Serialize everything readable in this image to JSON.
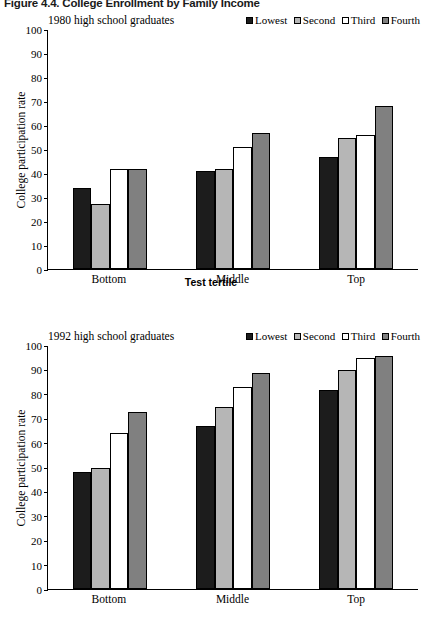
{
  "figure": {
    "title": "Figure 4.4.  College Enrollment by Family Income"
  },
  "colors": {
    "lowest": "#1c1c1c",
    "second": "#b6b6b6",
    "third": "#ffffff",
    "fourth": "#808080",
    "axis": "#000000",
    "background": "#ffffff"
  },
  "legend": {
    "items": [
      {
        "label": "Lowest",
        "color": "#1c1c1c"
      },
      {
        "label": "Second",
        "color": "#b6b6b6"
      },
      {
        "label": "Third",
        "color": "#ffffff"
      },
      {
        "label": "Fourth",
        "color": "#808080"
      }
    ]
  },
  "panels": [
    {
      "subtitle": "1980 high school graduates",
      "xlabel": "Test tertile"
    },
    {
      "subtitle": "1992 high school graduates",
      "xlabel": ""
    }
  ],
  "chart_data": [
    {
      "type": "bar",
      "title": "1980 high school graduates",
      "xlabel": "Test tertile",
      "ylabel": "College participation rate",
      "categories": [
        "Bottom",
        "Middle",
        "Top"
      ],
      "ylim": [
        0,
        100
      ],
      "yticks": [
        0,
        10,
        20,
        30,
        40,
        50,
        60,
        70,
        80,
        90,
        100
      ],
      "grid": false,
      "legend_position": "top-right",
      "series": [
        {
          "name": "Lowest",
          "color": "#1c1c1c",
          "values": [
            34,
            41,
            47
          ]
        },
        {
          "name": "Second",
          "color": "#b6b6b6",
          "values": [
            27,
            42,
            55
          ]
        },
        {
          "name": "Third",
          "color": "#ffffff",
          "values": [
            42,
            51,
            56
          ]
        },
        {
          "name": "Fourth",
          "color": "#808080",
          "values": [
            42,
            57,
            68
          ]
        }
      ]
    },
    {
      "type": "bar",
      "title": "1992 high school graduates",
      "xlabel": "",
      "ylabel": "College participation rate",
      "categories": [
        "Bottom",
        "Middle",
        "Top"
      ],
      "ylim": [
        0,
        100
      ],
      "yticks": [
        0,
        10,
        20,
        30,
        40,
        50,
        60,
        70,
        80,
        90,
        100
      ],
      "grid": false,
      "legend_position": "top-right",
      "series": [
        {
          "name": "Lowest",
          "color": "#1c1c1c",
          "values": [
            48,
            67,
            82
          ]
        },
        {
          "name": "Second",
          "color": "#b6b6b6",
          "values": [
            50,
            75,
            90
          ]
        },
        {
          "name": "Third",
          "color": "#ffffff",
          "values": [
            64,
            83,
            95
          ]
        },
        {
          "name": "Fourth",
          "color": "#808080",
          "values": [
            73,
            89,
            96
          ]
        }
      ]
    }
  ]
}
